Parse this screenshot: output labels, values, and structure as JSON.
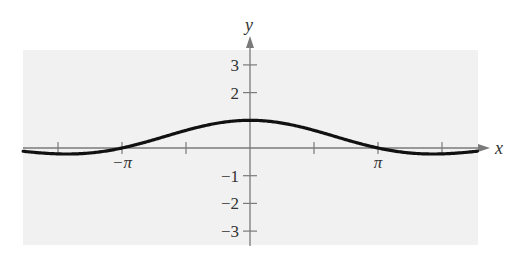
{
  "chart_data": {
    "type": "line",
    "title": "",
    "function": "y = sin(x)/x",
    "xlabel": "x",
    "ylabel": "y",
    "xlim": [
      -7.2,
      7.0
    ],
    "ylim": [
      -3.5,
      3.8
    ],
    "grid": false,
    "legend": null,
    "x_ticks": [
      {
        "value": -4.712,
        "label": ""
      },
      {
        "value": -3.1416,
        "label": "−π"
      },
      {
        "value": -1.5708,
        "label": ""
      },
      {
        "value": 1.5708,
        "label": ""
      },
      {
        "value": 3.1416,
        "label": "π"
      },
      {
        "value": 4.712,
        "label": ""
      }
    ],
    "y_ticks": [
      {
        "value": 3,
        "label": "3"
      },
      {
        "value": 2,
        "label": "2"
      },
      {
        "value": 1,
        "label": ""
      },
      {
        "value": -1,
        "label": "−1"
      },
      {
        "value": -2,
        "label": "−2"
      },
      {
        "value": -3,
        "label": "−3"
      }
    ],
    "series": [
      {
        "name": "sin(x)/x",
        "x": [
          -7.2,
          -6.2832,
          -5.5,
          -4.4934,
          -3.5,
          -3.1416,
          -2.5,
          -2.0,
          -1.5708,
          -1.0,
          -0.5,
          0,
          0.5,
          1.0,
          1.5708,
          2.0,
          2.5,
          3.1416,
          3.5,
          4.4934,
          5.5,
          6.2832,
          7.0
        ],
        "values": [
          0.1106,
          0.0,
          -0.1282,
          -0.2172,
          -0.1002,
          0.0,
          0.2394,
          0.4546,
          0.6366,
          0.8415,
          0.9589,
          1.0,
          0.9589,
          0.8415,
          0.6366,
          0.4546,
          0.2394,
          0.0,
          -0.1002,
          -0.2172,
          -0.1282,
          0.0,
          0.0939
        ]
      }
    ],
    "colors": {
      "panel": "#f1f1f1",
      "axis": "#7a7a7a",
      "curve": "#111111",
      "text": "#333333"
    }
  }
}
